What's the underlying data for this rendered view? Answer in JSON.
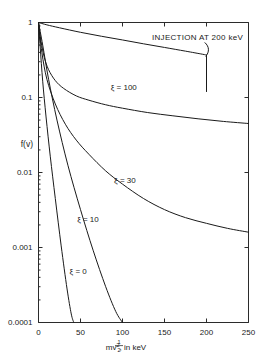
{
  "figure": {
    "background_color": "#ffffff",
    "ink_color": "#1a1a1a"
  },
  "chart_data": {
    "type": "line",
    "title": "",
    "subtitle": "",
    "xlabel_parts": {
      "numerator": "1",
      "denominator": "2",
      "body": "mv",
      "exponent": "2",
      "suffix": ", in keV"
    },
    "xlabel": "1/2 mv^2, in keV",
    "ylabel": "f(v)",
    "xscale": "linear",
    "yscale": "log",
    "xlim": [
      0,
      250
    ],
    "ylim": [
      0.0001,
      1
    ],
    "xticks": [
      0,
      50,
      100,
      150,
      200,
      250
    ],
    "xticklabels": [
      "0",
      "50",
      "100",
      "150",
      "200",
      "250"
    ],
    "yticks": [
      1,
      0.1,
      0.01,
      0.001,
      0.0001
    ],
    "yticklabels": [
      "1",
      "0.1",
      "0.01",
      "0.001",
      "0.0001"
    ],
    "grid": false,
    "legend_position": "inline-curve-labels",
    "annotations": [
      {
        "name": "injection-annotation",
        "text": "INJECTION AT 200 keV",
        "x_kev": 150,
        "y_value": 0.62,
        "points_to_x_kev": 200,
        "points_to_y_value": 0.35
      }
    ],
    "series": [
      {
        "name": "injection",
        "label": "INJECTION AT 200 keV",
        "label_kind": "annotation",
        "cutoff_x_kev": 200,
        "cutoff_drop_to": 0.12,
        "x": [
          0,
          10,
          25,
          50,
          75,
          100,
          125,
          150,
          175,
          195,
          200,
          200
        ],
        "y": [
          1.0,
          0.93,
          0.85,
          0.74,
          0.655,
          0.585,
          0.52,
          0.465,
          0.415,
          0.378,
          0.368,
          0.12
        ]
      },
      {
        "name": "xi-100",
        "label": "ξ = 100",
        "label_kind": "curve",
        "label_x_kev": 86,
        "label_y_value": 0.125,
        "x": [
          0,
          3,
          7,
          12,
          20,
          30,
          45,
          60,
          80,
          100,
          130,
          160,
          190,
          220,
          250
        ],
        "y": [
          1.0,
          0.56,
          0.34,
          0.235,
          0.168,
          0.132,
          0.105,
          0.092,
          0.08,
          0.072,
          0.063,
          0.057,
          0.052,
          0.048,
          0.045
        ]
      },
      {
        "name": "xi-30",
        "label": "ξ = 30",
        "label_kind": "curve",
        "label_x_kev": 90,
        "label_y_value": 0.0072,
        "x": [
          0,
          4,
          10,
          20,
          32,
          45,
          60,
          80,
          100,
          125,
          150,
          175,
          200,
          225,
          250
        ],
        "y": [
          1.0,
          0.4,
          0.175,
          0.082,
          0.044,
          0.027,
          0.0175,
          0.0105,
          0.007,
          0.0045,
          0.0032,
          0.0025,
          0.0021,
          0.0018,
          0.0016
        ]
      },
      {
        "name": "xi-10",
        "label": "ξ = 10",
        "label_kind": "curve",
        "label_x_kev": 46,
        "label_y_value": 0.0022,
        "x": [
          0,
          5,
          12,
          22,
          35,
          50,
          65,
          80,
          92,
          100
        ],
        "y": [
          1.0,
          0.5,
          0.175,
          0.05,
          0.0125,
          0.0032,
          0.00092,
          0.0003,
          0.00014,
          0.0001
        ]
      },
      {
        "name": "xi-0",
        "label": "ξ = 0",
        "label_kind": "curve",
        "label_x_kev": 37,
        "label_y_value": 0.00045,
        "x": [
          0,
          2,
          5,
          9,
          14,
          20,
          27,
          34,
          39,
          42
        ],
        "y": [
          1.0,
          0.47,
          0.165,
          0.055,
          0.0165,
          0.0045,
          0.00105,
          0.00028,
          0.00013,
          0.0001
        ]
      }
    ]
  }
}
